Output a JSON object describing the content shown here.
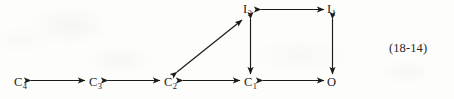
{
  "figure": {
    "type": "state-transition-diagram",
    "equation_number": "(18-14)",
    "background_color": "#fdfdfc",
    "ink_color": "#1b1b1b",
    "nodes": [
      {
        "id": "C4",
        "base": "C",
        "sub": "4",
        "x": 18,
        "y": 83
      },
      {
        "id": "C3",
        "base": "C",
        "sub": "3",
        "x": 93,
        "y": 83
      },
      {
        "id": "C2",
        "base": "C",
        "sub": "2",
        "x": 168,
        "y": 83
      },
      {
        "id": "C1",
        "base": "C",
        "sub": "1",
        "x": 248,
        "y": 83
      },
      {
        "id": "O",
        "base": "O",
        "sub": "",
        "x": 330,
        "y": 83
      },
      {
        "id": "I2",
        "base": "I",
        "sub": "2",
        "x": 247,
        "y": 11
      },
      {
        "id": "I1",
        "base": "I",
        "sub": "1",
        "x": 330,
        "y": 11
      }
    ],
    "edges": [
      {
        "id": "C4-C3",
        "from": "C4",
        "to": "C3",
        "orientation": "horizontal",
        "arrowheads": "both"
      },
      {
        "id": "C3-C2",
        "from": "C3",
        "to": "C2",
        "orientation": "horizontal",
        "arrowheads": "both"
      },
      {
        "id": "C2-C1",
        "from": "C2",
        "to": "C1",
        "orientation": "horizontal",
        "arrowheads": "both"
      },
      {
        "id": "C1-O",
        "from": "C1",
        "to": "O",
        "orientation": "horizontal",
        "arrowheads": "both"
      },
      {
        "id": "I2-I1",
        "from": "I2",
        "to": "I1",
        "orientation": "horizontal",
        "arrowheads": "both"
      },
      {
        "id": "I2-C1",
        "from": "I2",
        "to": "C1",
        "orientation": "vertical",
        "arrowheads": "both"
      },
      {
        "id": "I1-O",
        "from": "I1",
        "to": "O",
        "orientation": "vertical",
        "arrowheads": "both"
      },
      {
        "id": "C2-I2",
        "from": "C2",
        "to": "I2",
        "orientation": "diagonal",
        "arrowheads": "both"
      }
    ]
  }
}
